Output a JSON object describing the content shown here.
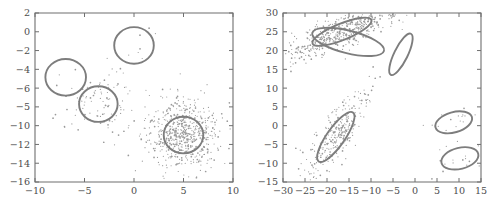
{
  "figure": {
    "background_color": "#ffffff",
    "axis_color": "#6f6f6f",
    "ellipse_color": "#7d7d7d",
    "point_color": "#9a9a9a",
    "panel_count": 2
  },
  "chart_data": [
    {
      "type": "scatter",
      "title": "",
      "subtitle": "",
      "xlabel": "",
      "ylabel": "",
      "panel": "left",
      "grid": false,
      "legend": null,
      "xlim": [
        -10,
        10
      ],
      "ylim": [
        -16,
        2
      ],
      "xticks": [
        -10,
        -5,
        0,
        5,
        10
      ],
      "xticklabels": [
        "-10",
        "-5",
        "0",
        "5",
        "10"
      ],
      "yticks": [
        2,
        0,
        -2,
        -4,
        -6,
        -8,
        -10,
        -12,
        -14,
        -16
      ],
      "yticklabels": [
        "2",
        "0",
        "-2",
        "-4",
        "-6",
        "-5",
        "-10",
        "-12",
        "-14",
        "-16"
      ],
      "annotations": [],
      "clusters": [
        {
          "name": "cluster-top-sparse",
          "shape": "circle",
          "center": [
            0.0,
            -1.45
          ],
          "rx": 2.0,
          "ry": 1.95,
          "rotation_deg": 0,
          "n_points": 8,
          "spread": "sparse"
        },
        {
          "name": "cluster-upper-left-sparse",
          "shape": "circle",
          "center": [
            -6.9,
            -4.85
          ],
          "rx": 2.05,
          "ry": 1.95,
          "rotation_deg": 0,
          "n_points": 7,
          "spread": "sparse"
        },
        {
          "name": "cluster-mid-left-medium",
          "shape": "circle",
          "center": [
            -3.6,
            -7.7
          ],
          "rx": 1.95,
          "ry": 1.9,
          "rotation_deg": 0,
          "n_points": 95,
          "spread": "medium"
        },
        {
          "name": "cluster-lower-right-dense",
          "shape": "circle",
          "center": [
            5.0,
            -11.0
          ],
          "rx": 2.0,
          "ry": 1.95,
          "rotation_deg": 0,
          "n_points": 620,
          "spread": "dense"
        }
      ]
    },
    {
      "type": "scatter",
      "title": "",
      "subtitle": "",
      "xlabel": "",
      "ylabel": "",
      "panel": "right",
      "grid": false,
      "legend": null,
      "xlim": [
        -30,
        15
      ],
      "ylim": [
        -15,
        30
      ],
      "xticks": [
        -30,
        -25,
        -20,
        -15,
        -10,
        -5,
        0,
        5,
        10,
        15
      ],
      "xticklabels": [
        "-30",
        "-25",
        "-20",
        "-15",
        "-10",
        "-5",
        "0",
        "5",
        "10",
        "15"
      ],
      "yticks": [
        30,
        25,
        20,
        15,
        10,
        5,
        0,
        -5,
        -10,
        -15
      ],
      "yticklabels": [
        "30",
        "25",
        "20",
        "15",
        "10",
        "5",
        "0",
        "-5",
        "-10",
        "-15"
      ],
      "annotations": [],
      "clusters": [
        {
          "name": "cluster-top-steep-dense",
          "shape": "ellipse",
          "center": [
            -16.6,
            25.0
          ],
          "rx": 7.2,
          "ry": 2.2,
          "rotation_deg": -22,
          "n_points": 520,
          "spread": "dense"
        },
        {
          "name": "cluster-top-wide-empty",
          "shape": "ellipse",
          "center": [
            -15.2,
            22.3
          ],
          "rx": 8.4,
          "ry": 3.0,
          "rotation_deg": 14,
          "n_points": 0,
          "spread": "empty"
        },
        {
          "name": "cluster-upper-right-narrow-empty",
          "shape": "ellipse",
          "center": [
            -3.2,
            19.0
          ],
          "rx": 5.2,
          "ry": 1.8,
          "rotation_deg": -64,
          "n_points": 0,
          "spread": "empty"
        },
        {
          "name": "cluster-lower-left-diagonal",
          "shape": "ellipse",
          "center": [
            -18.0,
            -3.0
          ],
          "rx": 6.8,
          "ry": 2.4,
          "rotation_deg": -55,
          "n_points": 300,
          "spread": "dense"
        },
        {
          "name": "cluster-right-upper-sparse",
          "shape": "ellipse",
          "center": [
            8.8,
            0.9
          ],
          "rx": 4.3,
          "ry": 2.7,
          "rotation_deg": -16,
          "n_points": 18,
          "spread": "sparse"
        },
        {
          "name": "cluster-right-lower-sparse",
          "shape": "ellipse",
          "center": [
            10.2,
            -8.7
          ],
          "rx": 4.3,
          "ry": 2.8,
          "rotation_deg": -14,
          "n_points": 14,
          "spread": "sparse"
        }
      ]
    }
  ]
}
